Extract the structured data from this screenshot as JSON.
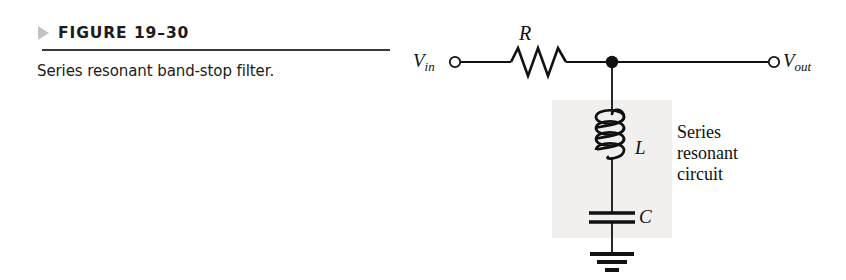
{
  "figure": {
    "marker_icon": "triangle-right-icon",
    "number": "FIGURE 19–30",
    "caption": "Series resonant band-stop filter."
  },
  "circuit": {
    "title": "Series resonant band-stop filter",
    "input_terminal": {
      "label_main": "V",
      "label_sub": "in",
      "icon": "open-terminal-icon"
    },
    "output_terminal": {
      "label_main": "V",
      "label_sub": "out",
      "icon": "open-terminal-icon"
    },
    "components": [
      {
        "id": "R",
        "label": "R",
        "type": "resistor",
        "icon": "resistor-zigzag-icon"
      },
      {
        "id": "L",
        "label": "L",
        "type": "inductor",
        "icon": "inductor-coil-icon"
      },
      {
        "id": "C",
        "label": "C",
        "type": "capacitor",
        "icon": "capacitor-plates-icon"
      }
    ],
    "junction_icon": "junction-dot-icon",
    "ground_icon": "ground-icon",
    "annotation": {
      "line1": "Series",
      "line2": "resonant",
      "line3": "circuit"
    }
  },
  "colors": {
    "ink": "#111111",
    "rule": "#3a3a3a",
    "marker": "#c3c3c3",
    "shade": "#f1f0ee",
    "background": "#ffffff"
  }
}
